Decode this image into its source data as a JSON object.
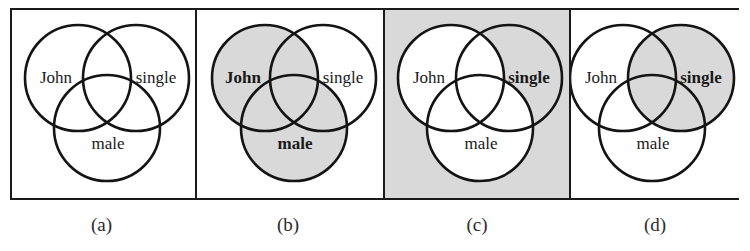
{
  "figure": {
    "title_text": "",
    "colors": {
      "shade": "#d9d9d9",
      "stroke": "#141414",
      "frame": "#1a1a1a",
      "background": "#ffffff",
      "text": "#1a1a1a"
    },
    "labels": {
      "john": "John",
      "single": "single",
      "male": "male"
    },
    "panels": [
      {
        "id": "a",
        "caption": "(a)",
        "background_shaded": false,
        "shaded_sets": [],
        "bold_labels": []
      },
      {
        "id": "b",
        "caption": "(b)",
        "background_shaded": false,
        "shaded_sets": [
          "john",
          "male"
        ],
        "bold_labels": [
          "john",
          "male"
        ]
      },
      {
        "id": "c",
        "caption": "(c)",
        "background_shaded": true,
        "shaded_sets": [
          "single"
        ],
        "unshaded_sets": [
          "john",
          "male"
        ],
        "bold_labels": [
          "single"
        ]
      },
      {
        "id": "d",
        "caption": "(d)",
        "background_shaded": false,
        "shaded_sets": [
          "single"
        ],
        "bold_labels": [
          "single"
        ]
      }
    ]
  }
}
